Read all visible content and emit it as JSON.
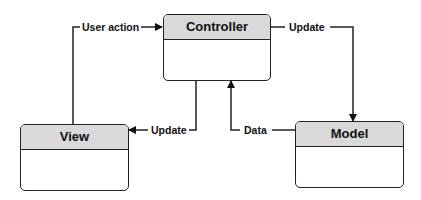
{
  "diagram": {
    "type": "MVC",
    "nodes": [
      {
        "id": "controller",
        "title": "Controller"
      },
      {
        "id": "view",
        "title": "View"
      },
      {
        "id": "model",
        "title": "Model"
      }
    ],
    "edges": [
      {
        "from": "view",
        "to": "controller",
        "label": "User action"
      },
      {
        "from": "controller",
        "to": "model",
        "label": "Update"
      },
      {
        "from": "controller",
        "to": "view",
        "label": "Update"
      },
      {
        "from": "model",
        "to": "controller",
        "label": "Data"
      }
    ]
  },
  "nodes": {
    "controller": {
      "title": "Controller"
    },
    "view": {
      "title": "View"
    },
    "model": {
      "title": "Model"
    }
  },
  "edges": {
    "user_action": "User action",
    "update_model": "Update",
    "update_view": "Update",
    "data": "Data"
  },
  "colors": {
    "header_fill": "#d9d9d9",
    "stroke": "#222222",
    "background": "#ffffff"
  }
}
